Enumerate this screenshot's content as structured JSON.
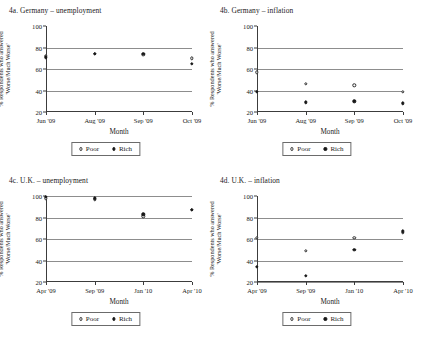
{
  "figure": {
    "panel_count": 4,
    "series_names": [
      "Poor",
      "Rich"
    ]
  },
  "chart_data": [
    {
      "type": "scatter",
      "panel_id": "4a",
      "title": "4a. Germany – unemployment",
      "xlabel": "Month",
      "ylabel_line1": "% Respondents who answered",
      "ylabel_line2": "'Worse/Much Worse'",
      "categories": [
        "Jun '09",
        "Aug '09",
        "Sep '09",
        "Oct '09"
      ],
      "ylim": [
        20,
        100
      ],
      "yticks": [
        20,
        40,
        60,
        80,
        100
      ],
      "gridlines": [
        40,
        60,
        80
      ],
      "grid": true,
      "legend_position": "bottom",
      "series": [
        {
          "name": "Poor",
          "marker": "open-circle",
          "values": [
            72,
            74,
            73,
            70
          ]
        },
        {
          "name": "Rich",
          "marker": "filled-circle",
          "values": [
            71,
            74,
            74,
            65
          ]
        }
      ]
    },
    {
      "type": "scatter",
      "panel_id": "4b",
      "title": "4b. Germany – inflation",
      "xlabel": "Month",
      "ylabel_line1": "% Respondents who answered",
      "ylabel_line2": "'Worse/Much Worse'",
      "categories": [
        "Jun '09",
        "Aug '09",
        "Sep '09",
        "Oct '09"
      ],
      "ylim": [
        20,
        100
      ],
      "yticks": [
        20,
        40,
        60,
        80,
        100
      ],
      "gridlines": [
        40,
        60,
        80
      ],
      "grid": true,
      "legend_position": "bottom",
      "series": [
        {
          "name": "Poor",
          "marker": "open-circle",
          "values": [
            57,
            46,
            45,
            39
          ]
        },
        {
          "name": "Rich",
          "marker": "filled-circle",
          "values": [
            39,
            29,
            30,
            28
          ]
        }
      ]
    },
    {
      "type": "scatter",
      "panel_id": "4c",
      "title": "4c. U.K. – unemployment",
      "xlabel": "Month",
      "ylabel_line1": "% Respondents who answered",
      "ylabel_line2": "'Worse/Much Worse'",
      "categories": [
        "Apr '09",
        "Sep '09",
        "Jan '10",
        "Apr '10"
      ],
      "ylim": [
        20,
        100
      ],
      "yticks": [
        20,
        40,
        60,
        80,
        100
      ],
      "gridlines": [
        40,
        60,
        80,
        100
      ],
      "grid": true,
      "legend_position": "bottom",
      "series": [
        {
          "name": "Poor",
          "marker": "open-circle",
          "values": [
            98,
            97,
            81,
            87
          ]
        },
        {
          "name": "Rich",
          "marker": "filled-circle",
          "values": [
            99,
            98,
            83,
            87
          ]
        }
      ]
    },
    {
      "type": "scatter",
      "panel_id": "4d",
      "title": "4d. U.K. – inflation",
      "xlabel": "Month",
      "ylabel_line1": "% Respondents who answered",
      "ylabel_line2": "'Worse/Much Worse'",
      "categories": [
        "Apr '09",
        "Sep '09",
        "Jan '10",
        "Apr '10"
      ],
      "ylim": [
        20,
        100
      ],
      "yticks": [
        20,
        40,
        60,
        80,
        100
      ],
      "gridlines": [
        20,
        40,
        60,
        80
      ],
      "grid": true,
      "legend_position": "bottom",
      "series": [
        {
          "name": "Poor",
          "marker": "open-circle",
          "values": [
            61,
            49,
            61,
            66
          ]
        },
        {
          "name": "Rich",
          "marker": "filled-circle",
          "values": [
            34,
            26,
            50,
            67
          ]
        }
      ]
    }
  ]
}
